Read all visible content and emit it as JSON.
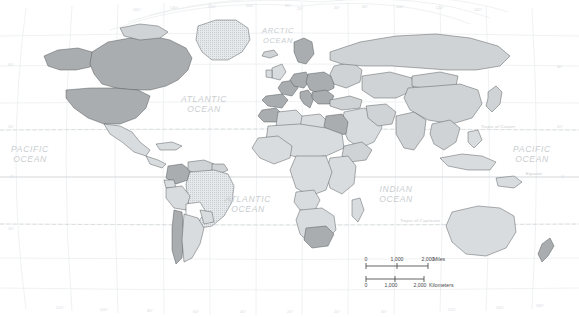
{
  "map": {
    "title": "World Map",
    "projection": "curved-graticule world map",
    "background_color": "#ffffff",
    "ocean_labels": [
      {
        "name": "arctic-ocean",
        "lines": [
          "ARCTIC",
          "OCEAN"
        ],
        "x": 278,
        "y": 33,
        "size": "small"
      },
      {
        "name": "atlantic-ocean-north",
        "lines": [
          "ATLANTIC",
          "OCEAN"
        ],
        "x": 204,
        "y": 102,
        "size": "normal"
      },
      {
        "name": "atlantic-ocean-south",
        "lines": [
          "ATLANTIC",
          "OCEAN"
        ],
        "x": 248,
        "y": 202,
        "size": "normal"
      },
      {
        "name": "pacific-ocean-east",
        "lines": [
          "PACIFIC",
          "OCEAN"
        ],
        "x": 30,
        "y": 152,
        "size": "normal"
      },
      {
        "name": "pacific-ocean-west",
        "lines": [
          "PACIFIC",
          "OCEAN"
        ],
        "x": 532,
        "y": 152,
        "size": "normal"
      },
      {
        "name": "indian-ocean",
        "lines": [
          "INDIAN",
          "OCEAN"
        ],
        "x": 396,
        "y": 192,
        "size": "normal"
      }
    ],
    "reference_lines": [
      {
        "name": "tropic-of-cancer",
        "label": "Tropic of Cancer",
        "y": 130,
        "label_x": 498
      },
      {
        "name": "equator",
        "label": "Equator",
        "y": 177,
        "label_x": 534
      },
      {
        "name": "tropic-of-capricorn",
        "label": "Tropic of Capricorn",
        "y": 224,
        "label_x": 420
      }
    ],
    "latitude_labels": [
      {
        "value": "60°",
        "side": "left",
        "x": 8,
        "y": 66
      },
      {
        "value": "30°",
        "side": "left",
        "x": 8,
        "y": 128
      },
      {
        "value": "0°",
        "side": "left",
        "x": 10,
        "y": 178
      },
      {
        "value": "30°",
        "side": "left",
        "x": 8,
        "y": 230
      },
      {
        "value": "40°",
        "side": "right",
        "x": 563,
        "y": 68
      },
      {
        "value": "20°",
        "side": "right",
        "x": 563,
        "y": 128
      },
      {
        "value": "0°",
        "side": "right",
        "x": 565,
        "y": 178
      }
    ],
    "longitude_labels_top": [
      {
        "value": "160°",
        "x": 137,
        "y": 11
      },
      {
        "value": "140°",
        "x": 174,
        "y": 9
      },
      {
        "value": "120°",
        "x": 212,
        "y": 8
      },
      {
        "value": "100°",
        "x": 250,
        "y": 7
      },
      {
        "value": "80°",
        "x": 288,
        "y": 7
      },
      {
        "value": "20°",
        "x": 300,
        "y": 10
      },
      {
        "value": "40°",
        "x": 337,
        "y": 9
      },
      {
        "value": "60°",
        "x": 365,
        "y": 8
      },
      {
        "value": "100°",
        "x": 400,
        "y": 8
      },
      {
        "value": "120°",
        "x": 440,
        "y": 9
      },
      {
        "value": "160°",
        "x": 478,
        "y": 11
      }
    ],
    "longitude_labels_bottom": [
      {
        "value": "120°",
        "x": 60,
        "y": 309
      },
      {
        "value": "100°",
        "x": 104,
        "y": 311
      },
      {
        "value": "80°",
        "x": 150,
        "y": 312
      },
      {
        "value": "60°",
        "x": 196,
        "y": 313
      },
      {
        "value": "40°",
        "x": 243,
        "y": 313
      },
      {
        "value": "20°",
        "x": 290,
        "y": 313
      },
      {
        "value": "20°",
        "x": 337,
        "y": 313
      },
      {
        "value": "60°",
        "x": 384,
        "y": 313
      },
      {
        "value": "120°",
        "x": 452,
        "y": 311
      },
      {
        "value": "160°",
        "x": 500,
        "y": 309
      },
      {
        "value": "180°",
        "x": 540,
        "y": 307
      }
    ]
  },
  "scale_bar": {
    "name": "map-scale-bar",
    "miles": {
      "ticks": [
        "0",
        "1,000",
        "2,000"
      ],
      "unit_label": "Miles"
    },
    "kilometers": {
      "ticks": [
        "0",
        "1,000",
        "2,000"
      ],
      "unit_label": "Kilometers"
    }
  },
  "legend_shades": {
    "land_default": "#d9dcde",
    "land_highlight": "#a9adb0",
    "land_light": "#ececee",
    "land_white": "#fdfdfd",
    "border_color": "#4c5052",
    "graticule_color": "#e3e6e8"
  }
}
